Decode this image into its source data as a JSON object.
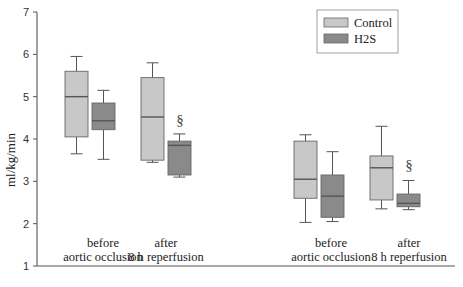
{
  "chart_data": {
    "type": "box",
    "title": "",
    "xlabel": "",
    "ylabel": "ml/kg/min",
    "ylim": [
      1,
      7
    ],
    "yticks": [
      1,
      2,
      3,
      4,
      5,
      6,
      7
    ],
    "grid": false,
    "legend_position": "top-right",
    "categories": [
      "before aortic occlusion",
      "after 8 h reperfusion",
      "before aortic occlusion",
      "after 8 h reperfusion"
    ],
    "category_lines": [
      [
        "before",
        "aortic occlusion"
      ],
      [
        "after",
        "8 h reperfusion"
      ],
      [
        "before",
        "aortic occlusion"
      ],
      [
        "after",
        "8 h reperfusion"
      ]
    ],
    "series": [
      {
        "name": "Control",
        "color": "#c8c8c8",
        "boxes": [
          {
            "whisker_low": 3.65,
            "q1": 4.05,
            "median": 5.0,
            "q3": 5.6,
            "whisker_high": 5.95
          },
          {
            "whisker_low": 3.45,
            "q1": 3.5,
            "median": 4.52,
            "q3": 5.45,
            "whisker_high": 5.8
          },
          {
            "whisker_low": 2.03,
            "q1": 2.6,
            "median": 3.05,
            "q3": 3.95,
            "whisker_high": 4.1
          },
          {
            "whisker_low": 2.35,
            "q1": 2.56,
            "median": 3.32,
            "q3": 3.6,
            "whisker_high": 4.3
          }
        ]
      },
      {
        "name": "H2S",
        "color": "#8a8a8a",
        "boxes": [
          {
            "whisker_low": 3.52,
            "q1": 4.22,
            "median": 4.43,
            "q3": 4.85,
            "whisker_high": 5.15
          },
          {
            "whisker_low": 3.1,
            "q1": 3.15,
            "median": 3.85,
            "q3": 3.95,
            "whisker_high": 4.12
          },
          {
            "whisker_low": 2.05,
            "q1": 2.15,
            "median": 2.65,
            "q3": 3.15,
            "whisker_high": 3.7
          },
          {
            "whisker_low": 2.33,
            "q1": 2.4,
            "median": 2.48,
            "q3": 2.7,
            "whisker_high": 3.02
          }
        ]
      }
    ],
    "annotations": [
      {
        "text": "§",
        "category_index": 1,
        "series": "H2S"
      },
      {
        "text": "§",
        "category_index": 3,
        "series": "H2S"
      }
    ]
  },
  "legend": {
    "items": [
      {
        "label": "Control",
        "color": "#c8c8c8"
      },
      {
        "label": "H2S",
        "color": "#8a8a8a"
      }
    ]
  },
  "axis": {
    "ylabel": "ml/kg/min",
    "ytick_labels": [
      "1",
      "2",
      "3",
      "4",
      "5",
      "6",
      "7"
    ]
  },
  "colors": {
    "axis": "#555555",
    "whisker": "#555555",
    "box_edge": "#666666",
    "median": "#555555"
  }
}
